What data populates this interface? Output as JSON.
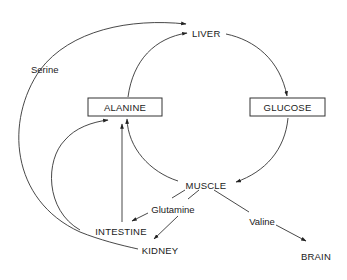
{
  "diagram": {
    "title": "",
    "nodes": {
      "liver": "LIVER",
      "alanine": "ALANINE",
      "glucose": "GLUCOSE",
      "muscle": "MUSCLE",
      "intestine": "INTESTINE",
      "kidney": "KIDNEY",
      "brain": "BRAIN"
    },
    "edge_labels": {
      "serine": "Serine",
      "glutamine": "Glutamine",
      "valine": "Valine"
    },
    "edges": [
      {
        "from": "KIDNEY",
        "to": "LIVER",
        "label": "Serine"
      },
      {
        "from": "ALANINE",
        "to": "LIVER",
        "label": ""
      },
      {
        "from": "LIVER",
        "to": "GLUCOSE",
        "label": ""
      },
      {
        "from": "GLUCOSE",
        "to": "MUSCLE",
        "label": ""
      },
      {
        "from": "MUSCLE",
        "to": "ALANINE",
        "label": ""
      },
      {
        "from": "MUSCLE",
        "to": "INTESTINE",
        "label": "Glutamine"
      },
      {
        "from": "MUSCLE",
        "to": "KIDNEY",
        "label": "Glutamine"
      },
      {
        "from": "INTESTINE",
        "to": "ALANINE",
        "label": ""
      },
      {
        "from": "KIDNEY",
        "to": "ALANINE",
        "label": ""
      },
      {
        "from": "MUSCLE",
        "to": "BRAIN",
        "label": "Valine"
      }
    ],
    "colors": {
      "stroke": "#333333",
      "text": "#1a1a1a",
      "background": "#ffffff"
    }
  }
}
